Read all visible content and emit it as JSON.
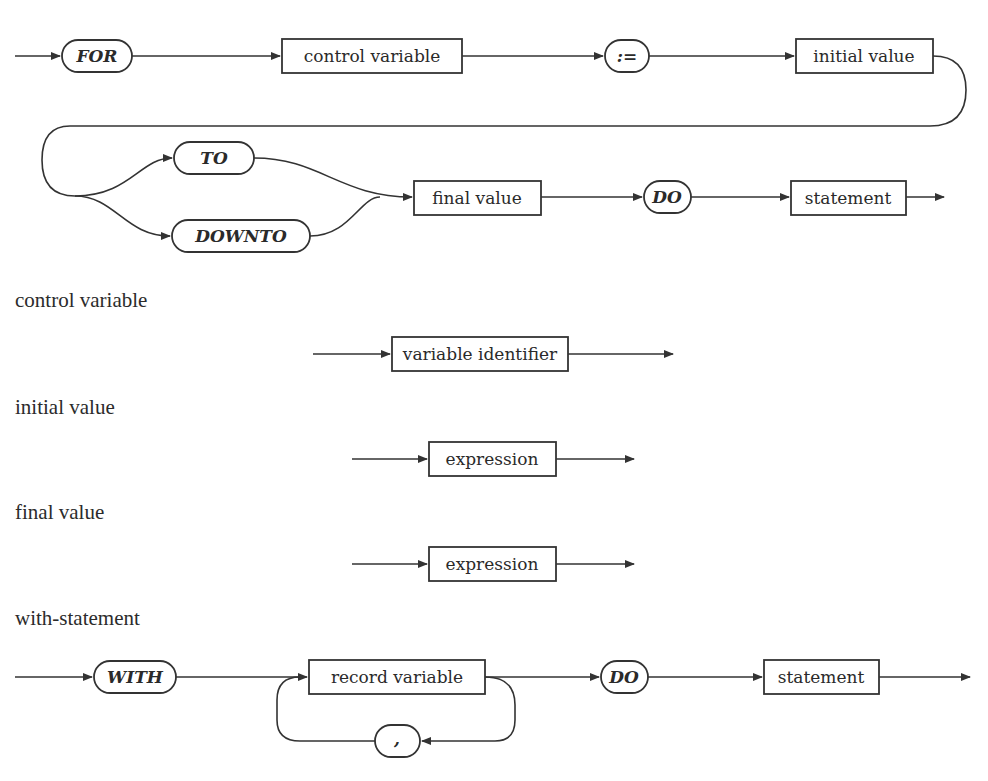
{
  "diagrams": {
    "for_statement": {
      "header_cut_off": "",
      "keywords": {
        "for": "FOR",
        "assign": ":=",
        "to": "TO",
        "downto": "DOWNTO",
        "do": "DO"
      },
      "boxes": {
        "control_variable": "control variable",
        "initial_value": "initial value",
        "final_value": "final value",
        "statement": "statement"
      }
    },
    "control_variable": {
      "title": "control variable",
      "boxes": {
        "variable_identifier": "variable identifier"
      }
    },
    "initial_value": {
      "title": "initial value",
      "boxes": {
        "expression": "expression"
      }
    },
    "final_value": {
      "title": "final value",
      "boxes": {
        "expression": "expression"
      }
    },
    "with_statement": {
      "title": "with-statement",
      "keywords": {
        "with": "WITH",
        "do": "DO",
        "comma": ","
      },
      "boxes": {
        "record_variable": "record variable",
        "statement": "statement"
      }
    }
  },
  "colors": {
    "line": "#333333",
    "text": "#2a2a2a",
    "background": "#ffffff"
  }
}
